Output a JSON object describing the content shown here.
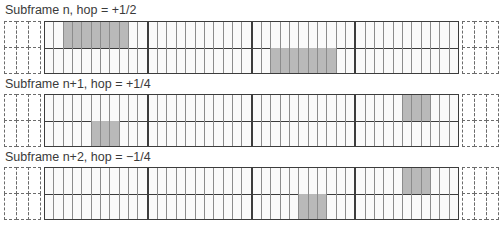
{
  "diagram": {
    "cells_per_section": 11,
    "sections": 4,
    "total_cells": 44,
    "shade_color": "#b9b9b9",
    "line_color": "#3c3c3c",
    "panels": [
      {
        "title": "Subframe n, hop = +1/2",
        "top_shaded": [
          2,
          3,
          4,
          5,
          6,
          7,
          8
        ],
        "bottom_shaded": [
          24,
          25,
          26,
          27,
          28,
          29,
          30
        ]
      },
      {
        "title": "Subframe n+1, hop = +1/4",
        "top_shaded": [
          38,
          39,
          40
        ],
        "bottom_shaded": [
          5,
          6,
          7
        ]
      },
      {
        "title": "Subframe n+2, hop = −1/4",
        "top_shaded": [
          38,
          39,
          40
        ],
        "bottom_shaded": [
          27,
          28,
          29
        ]
      }
    ]
  }
}
